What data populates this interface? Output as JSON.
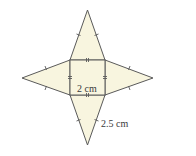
{
  "diagram": {
    "type": "square-pyramid-net",
    "colors": {
      "fill": "#f8f5df",
      "stroke": "#5a5a5a",
      "text": "#3a3a3a"
    },
    "square": {
      "x": 70,
      "y": 60,
      "size": 35
    },
    "apexes": {
      "top": [
        87.5,
        10
      ],
      "left": [
        22,
        78
      ],
      "right": [
        153,
        78
      ],
      "bottom": [
        87.5,
        145
      ]
    },
    "labels": {
      "base_side": "2 cm",
      "slant_edge": "2.5 cm"
    }
  }
}
